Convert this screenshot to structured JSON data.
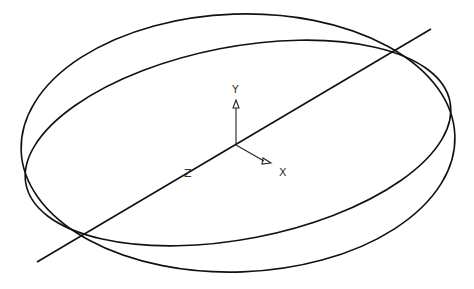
{
  "diagram": {
    "type": "3d-wireframe-view",
    "background": "#ffffff",
    "stroke_color": "#111111",
    "elements": {
      "outer_ellipse": {
        "cx": 238,
        "cy": 143,
        "rx": 217,
        "ry": 129,
        "rotation_deg": -2
      },
      "inner_ellipse": {
        "cx": 238,
        "cy": 143,
        "rx": 216,
        "ry": 96,
        "rotation_deg": -11
      },
      "z_axis_line": {
        "x1": 37,
        "y1": 262,
        "x2": 431,
        "y2": 29
      }
    },
    "triad": {
      "origin": {
        "x": 236,
        "y": 145
      },
      "labels": {
        "y": "Y",
        "x": "X",
        "z": "Z"
      }
    }
  }
}
